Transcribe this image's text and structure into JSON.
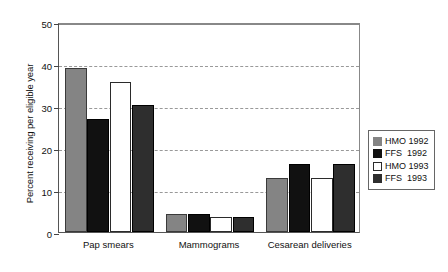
{
  "chart_data": {
    "type": "bar",
    "title": "",
    "subtitle": "",
    "xlabel": "",
    "ylabel": "Percent receiving per eligible year",
    "ylim": [
      0,
      50
    ],
    "yticks": [
      0,
      10,
      20,
      30,
      40,
      50
    ],
    "ytick_labels": [
      "0",
      "10",
      "20",
      "30",
      "40",
      "50"
    ],
    "grid": "horizontal dashed gridlines at 10, 20, 30, 40, 50",
    "legend_position": "right, outside plot area",
    "categories": [
      "Pap smears",
      "Mammograms",
      "Cesarean deliveries"
    ],
    "series": [
      {
        "name": "HMO 1992",
        "color": "#848484",
        "border": "#3a3a3a",
        "values": [
          39.1,
          4.4,
          12.9
        ]
      },
      {
        "name": "FFS  1992",
        "color": "#111111",
        "border": "#000000",
        "values": [
          27.0,
          4.4,
          16.1
        ]
      },
      {
        "name": "HMO 1993",
        "color": "#ffffff",
        "border": "#2b2b2b",
        "values": [
          35.6,
          3.6,
          12.8
        ]
      },
      {
        "name": "FFS  1993",
        "color": "#2e2e2e",
        "border": "#000000",
        "values": [
          30.3,
          3.6,
          16.2
        ]
      }
    ]
  },
  "legend": {
    "entries": [
      {
        "label": "HMO 1992",
        "swatch": "#848484"
      },
      {
        "label": "FFS  1992",
        "swatch": "#111111"
      },
      {
        "label": "HMO 1993",
        "swatch": "#ffffff"
      },
      {
        "label": "FFS  1993",
        "swatch": "#2e2e2e"
      }
    ]
  },
  "axes": {
    "y_title": "Percent receiving per eligible year"
  }
}
